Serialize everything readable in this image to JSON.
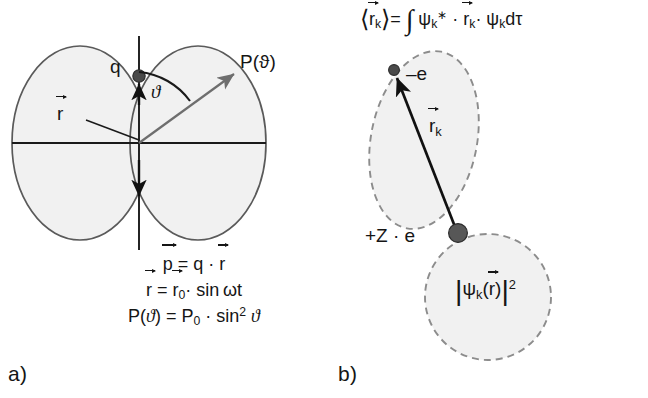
{
  "figure": {
    "caption_panels": {
      "a_letter": "a)",
      "b_letter": "b)"
    },
    "colors": {
      "lobe_fill": "#f1f1f1",
      "lobe_stroke": "#5a5a5a",
      "dashed_stroke": "#8c8c8c",
      "axis_stroke": "#1a1a1a",
      "charge_dot": "#4a4a4a",
      "arrow_stroke": "#6e6e6e",
      "text": "#151515",
      "background": "#ffffff"
    }
  },
  "panel_a": {
    "title": "Hertzian dipole radiation pattern",
    "labels": {
      "charge": "q",
      "angle": "ϑ",
      "power": "P(ϑ)",
      "radius_vector": "r"
    },
    "formulas": [
      {
        "id": "dipole-moment",
        "text": "p = q · r",
        "lhs": "p",
        "rhs": "q · r"
      },
      {
        "id": "oscillation",
        "text": "r = r₀ · sin ωt",
        "lhs": "r",
        "rhs": "r₀ · sin ωt"
      },
      {
        "id": "radiated-power",
        "text": "P(ϑ) = P₀ · sin² ϑ",
        "lhs": "P(ϑ)",
        "rhs": "P₀ · sin² ϑ"
      }
    ],
    "geometry": {
      "lobe_count": 2,
      "axis_orientation": "vertical dipole, horizontal reference axis",
      "angle_measured_from": "dipole axis (vertical)"
    }
  },
  "panel_b": {
    "title": "Transition dipole moment of an atom",
    "equation": {
      "id": "expectation-value",
      "text": "⟨rₖ⟩ = ∫ ψₖ* · rₖ · ψₖ dτ",
      "lhs": "⟨rₖ⟩",
      "rhs": "∫ ψₖ* · rₖ · ψₖ dτ"
    },
    "labels": {
      "electron": "–e",
      "vector": "rₖ",
      "nucleus": "+Z · e",
      "probability_density": "|ψₖ(r)|²"
    },
    "geometry": {
      "upper_lobe": "tilted dashed ellipse (excited-state orbital)",
      "lower_lobe": "dashed circle (ground-state orbital)",
      "vector_from": "nucleus",
      "vector_to": "electron"
    }
  }
}
